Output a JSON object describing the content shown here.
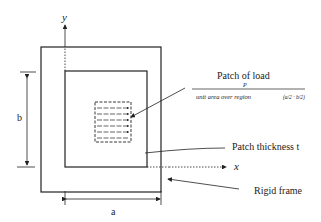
{
  "diagram": {
    "axes": {
      "x_label": "x",
      "y_label": "y"
    },
    "dimensions": {
      "width_label": "a",
      "height_label": "b"
    },
    "annotations": {
      "patch_of_load": "Patch of load",
      "load_numerator": "P",
      "load_denominator": "unit area over region",
      "region_expr": "(a/2 · b/2)",
      "patch_thickness": "Patch thickness t",
      "rigid_frame": "Rigid frame"
    },
    "colors": {
      "line": "#222222",
      "background": "#ffffff"
    }
  }
}
